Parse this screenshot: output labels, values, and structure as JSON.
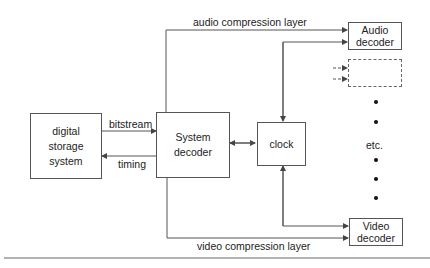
{
  "diagram": {
    "nodes": {
      "storage": {
        "lines": [
          "digital",
          "storage",
          "system"
        ]
      },
      "system_decoder": {
        "lines": [
          "System",
          "decoder"
        ]
      },
      "clock": {
        "label": "clock"
      },
      "audio_decoder": {
        "lines": [
          "Audio",
          "decoder"
        ]
      },
      "placeholder_decoder": {
        "lines": []
      },
      "video_decoder": {
        "lines": [
          "Video",
          "decoder"
        ]
      }
    },
    "edges": {
      "bitstream": "bitstream",
      "timing": "timing",
      "audio_layer": "audio compression layer",
      "video_layer": "video compression layer"
    },
    "ellipsis": "etc.",
    "colors": {
      "line": "#555555",
      "background": "#ffffff",
      "text": "#222222"
    }
  }
}
